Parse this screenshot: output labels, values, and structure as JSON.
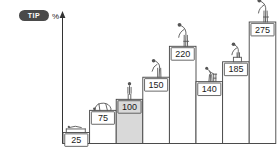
{
  "badge": {
    "label": "TIP"
  },
  "axis": {
    "unit_label": "%",
    "y_arrow": "up-arrow"
  },
  "chart_data": {
    "type": "bar",
    "title": "",
    "subtitle": "",
    "xlabel": "",
    "ylabel": "%",
    "ylim": [
      0,
      300
    ],
    "grid": false,
    "legend": "none",
    "categories": [
      "1",
      "2",
      "3",
      "4",
      "5",
      "6",
      "7",
      "8"
    ],
    "values": [
      25,
      75,
      100,
      150,
      220,
      140,
      185,
      275
    ],
    "value_labels": [
      "25",
      "75",
      "100",
      "150",
      "220",
      "140",
      "185",
      "275"
    ],
    "highlight_index": 2,
    "bars": [
      {
        "label": "25",
        "value": 25,
        "highlight": false,
        "figure": "figure-lying-flat"
      },
      {
        "label": "75",
        "value": 75,
        "highlight": false,
        "figure": "figure-crouching"
      },
      {
        "label": "100",
        "value": 100,
        "highlight": true,
        "figure": "figure-standing"
      },
      {
        "label": "150",
        "value": 150,
        "highlight": false,
        "figure": "figure-bending-forward"
      },
      {
        "label": "220",
        "value": 220,
        "highlight": false,
        "figure": "figure-bending-deep"
      },
      {
        "label": "140",
        "value": 140,
        "highlight": false,
        "figure": "figure-with-walker"
      },
      {
        "label": "185",
        "value": 185,
        "highlight": false,
        "figure": "figure-leaning"
      },
      {
        "label": "275",
        "value": 275,
        "highlight": false,
        "figure": "figure-bending-deep"
      }
    ]
  },
  "colors": {
    "background": "#ffffff",
    "bar_stroke": "#444444",
    "bar_fill": "#ffffff",
    "bar_highlight_fill": "#d9d9d9",
    "badge_background": "#4a4a4a",
    "badge_text": "#ffffff",
    "axis": "#333333",
    "figure": "#555555",
    "value_text": "#1a1a1a"
  }
}
